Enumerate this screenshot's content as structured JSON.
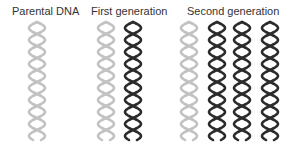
{
  "labels": {
    "parental": "Parental DNA",
    "first": "First generation",
    "second": "Second generation"
  },
  "colors": {
    "light": "#c2c2c2",
    "dark": "#2b2b2b"
  },
  "helix": {
    "top": 22,
    "bottom": 140,
    "half_width": 8,
    "period": 24,
    "stroke_width": 2.6
  },
  "groups": [
    {
      "name": "parental",
      "helices": [
        {
          "x": 37,
          "shade": "light"
        }
      ]
    },
    {
      "name": "first-generation",
      "helices": [
        {
          "x": 106,
          "shade": "light"
        },
        {
          "x": 133,
          "shade": "dark"
        }
      ]
    },
    {
      "name": "second-generation",
      "helices": [
        {
          "x": 189,
          "shade": "light"
        },
        {
          "x": 217,
          "shade": "dark"
        },
        {
          "x": 242,
          "shade": "dark"
        },
        {
          "x": 270,
          "shade": "dark"
        }
      ]
    }
  ]
}
